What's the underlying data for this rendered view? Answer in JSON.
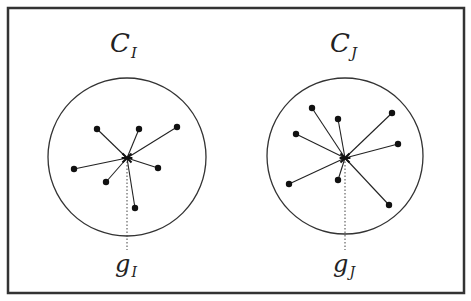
{
  "diagram": {
    "frame": {
      "x": 8,
      "y": 8,
      "w": 456,
      "h": 285
    },
    "clusters": [
      {
        "label": "C",
        "label_sub": "I",
        "label_pos": [
          110,
          52
        ],
        "circle": {
          "cx": 127,
          "cy": 157,
          "r": 79
        },
        "centroid": {
          "x": 127,
          "y": 158,
          "label": "g",
          "label_sub": "I",
          "label_pos": [
            115,
            272
          ]
        },
        "dotted_line_end_y": 250,
        "points": [
          [
            97,
            129
          ],
          [
            139,
            129
          ],
          [
            177,
            127
          ],
          [
            74,
            169
          ],
          [
            106,
            182
          ],
          [
            158,
            168
          ],
          [
            135,
            208
          ]
        ]
      },
      {
        "label": "C",
        "label_sub": "J",
        "label_pos": [
          330,
          52
        ],
        "circle": {
          "cx": 345,
          "cy": 156,
          "r": 78
        },
        "centroid": {
          "x": 345,
          "y": 158,
          "label": "g",
          "label_sub": "J",
          "label_pos": [
            333,
            272
          ]
        },
        "dotted_line_end_y": 250,
        "points": [
          [
            312,
            108
          ],
          [
            338,
            119
          ],
          [
            392,
            113
          ],
          [
            296,
            134
          ],
          [
            398,
            144
          ],
          [
            289,
            184
          ],
          [
            338,
            180
          ],
          [
            389,
            205
          ]
        ]
      }
    ]
  }
}
